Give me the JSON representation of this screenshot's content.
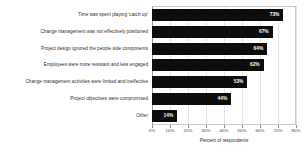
{
  "chart_data": {
    "type": "bar",
    "orientation": "horizontal",
    "title": "",
    "subtitle": "",
    "xlabel": "Percent of respondents",
    "ylabel": "",
    "xlim": [
      0,
      80
    ],
    "ylim": null,
    "grid": true,
    "legend": false,
    "legend_position": "none",
    "value_label_suffix": "%",
    "value_label_position": "inside-end",
    "bar_color": "#0d0d0d",
    "value_label_color": "#ffffff",
    "background_color": "#ffffff",
    "categories": [
      "Time was spent playing 'catch up'",
      "Change management was not effectively positioned",
      "Project design ignored the people side components",
      "Employees were more resistant and less engaged",
      "Change management activities were limited and ineffective",
      "Project objectives were compromised",
      "Other"
    ],
    "values": [
      73,
      67,
      64,
      62,
      53,
      44,
      14
    ],
    "value_labels": [
      "73%",
      "67%",
      "64%",
      "62%",
      "53%",
      "44%",
      "14%"
    ],
    "xticks": [
      0,
      10,
      20,
      30,
      40,
      50,
      60,
      70,
      80
    ],
    "xtick_labels": [
      "0%",
      "10%",
      "20%",
      "30%",
      "40%",
      "50%",
      "60%",
      "70%",
      "80%"
    ]
  }
}
